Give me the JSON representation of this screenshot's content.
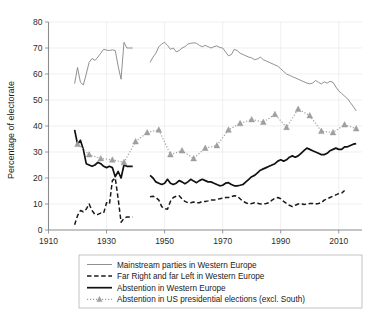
{
  "chart_data": {
    "type": "line",
    "title": "",
    "xlabel": "",
    "ylabel": "Percentage of electorate",
    "xlim": [
      1910,
      2018
    ],
    "ylim": [
      0,
      80
    ],
    "grid": true,
    "legend_position": "bottom",
    "x_ticks": [
      "1910",
      "1930",
      "1950",
      "1970",
      "1990",
      "2010"
    ],
    "x_tick_values": [
      1910,
      1930,
      1950,
      1970,
      1990,
      2010
    ],
    "y_ticks": [
      "0",
      "10",
      "20",
      "30",
      "40",
      "50",
      "60",
      "70",
      "80"
    ],
    "y_tick_values": [
      0,
      10,
      20,
      30,
      40,
      50,
      60,
      70,
      80
    ],
    "colors": {
      "mainstream": "#8a8a8a",
      "far_right_left": "#1a1a1a",
      "abstention_we": "#111111",
      "abstention_us": "#a0a0a0",
      "grid": "#e9e9e9",
      "axis": "#8c8c8c",
      "text": "#1a1a1a"
    },
    "series": [
      {
        "name": "Mainstream parties in Western Europe",
        "style": "thin-solid",
        "color": "#8a8a8a",
        "segments": [
          {
            "x": [
              1919,
              1920,
              1921,
              1922,
              1923,
              1924,
              1925,
              1926,
              1927,
              1928,
              1929,
              1930,
              1931,
              1932,
              1933,
              1934,
              1935,
              1936,
              1937,
              1938,
              1939
            ],
            "y": [
              56.3,
              62.5,
              56.8,
              55.8,
              60.0,
              64.5,
              66.0,
              65.2,
              66.5,
              68.0,
              69.5,
              69.2,
              69.0,
              69.3,
              69.0,
              63.0,
              58.0,
              72.2,
              70.0,
              70.0,
              70.0
            ]
          },
          {
            "x": [
              1945,
              1946,
              1947,
              1948,
              1949,
              1950,
              1951,
              1952,
              1953,
              1954,
              1955,
              1956,
              1957,
              1958,
              1959,
              1960,
              1961,
              1962,
              1963,
              1964,
              1965,
              1966,
              1967,
              1968,
              1969,
              1970,
              1971,
              1972,
              1973,
              1974,
              1975,
              1976,
              1977,
              1978,
              1979,
              1980,
              1981,
              1982,
              1983,
              1984,
              1985,
              1986,
              1987,
              1988,
              1989,
              1990,
              1991,
              1992,
              1993,
              1994,
              1995,
              1996,
              1997,
              1998,
              1999,
              2000,
              2001,
              2002,
              2003,
              2004,
              2005,
              2006,
              2007,
              2008,
              2009,
              2010,
              2011,
              2012,
              2013,
              2014,
              2015,
              2016
            ],
            "y": [
              64.5,
              66.5,
              68.0,
              70.5,
              71.5,
              72.2,
              71.0,
              69.5,
              70.0,
              68.5,
              69.0,
              70.0,
              70.5,
              71.5,
              71.8,
              72.0,
              71.8,
              71.0,
              70.5,
              71.0,
              70.5,
              70.0,
              70.5,
              70.8,
              70.2,
              70.0,
              68.5,
              67.0,
              67.5,
              69.5,
              69.0,
              68.0,
              67.5,
              67.0,
              66.5,
              66.2,
              65.5,
              65.8,
              66.5,
              65.5,
              65.0,
              64.5,
              64.0,
              63.5,
              63.0,
              62.0,
              61.0,
              60.0,
              59.5,
              59.0,
              58.5,
              58.0,
              57.5,
              57.0,
              56.5,
              56.2,
              56.5,
              57.5,
              56.8,
              56.2,
              57.0,
              56.5,
              57.2,
              56.8,
              55.0,
              53.5,
              52.5,
              51.5,
              50.5,
              49.0,
              47.5,
              45.8
            ]
          }
        ]
      },
      {
        "name": "Far Right and far Left in Western Europe",
        "style": "dashed",
        "color": "#1a1a1a",
        "segments": [
          {
            "x": [
              1919,
              1920,
              1921,
              1922,
              1923,
              1924,
              1925,
              1926,
              1927,
              1928,
              1929,
              1930,
              1931,
              1932,
              1933,
              1934,
              1935,
              1936,
              1937,
              1938,
              1939
            ],
            "y": [
              2.0,
              5.5,
              7.5,
              7.0,
              8.0,
              10.0,
              7.5,
              6.0,
              6.0,
              6.5,
              6.5,
              10.5,
              10.0,
              19.0,
              20.0,
              12.0,
              3.0,
              4.5,
              5.0,
              5.0,
              5.0
            ]
          },
          {
            "x": [
              1945,
              1946,
              1947,
              1948,
              1949,
              1950,
              1951,
              1952,
              1953,
              1954,
              1955,
              1956,
              1957,
              1958,
              1959,
              1960,
              1961,
              1962,
              1963,
              1964,
              1965,
              1966,
              1967,
              1968,
              1969,
              1970,
              1971,
              1972,
              1973,
              1974,
              1975,
              1976,
              1977,
              1978,
              1979,
              1980,
              1981,
              1982,
              1983,
              1984,
              1985,
              1986,
              1987,
              1988,
              1989,
              1990,
              1991,
              1992,
              1993,
              1994,
              1995,
              1996,
              1997,
              1998,
              1999,
              2000,
              2001,
              2002,
              2003,
              2004,
              2005,
              2006,
              2007,
              2008,
              2009,
              2010,
              2011,
              2012,
              2013,
              2014,
              2015,
              2016
            ],
            "y": [
              12.8,
              13.0,
              12.5,
              11.5,
              9.0,
              8.2,
              8.0,
              11.0,
              12.5,
              13.0,
              13.2,
              12.0,
              11.0,
              10.5,
              10.5,
              10.8,
              10.5,
              10.5,
              11.0,
              11.0,
              11.2,
              11.5,
              11.5,
              11.8,
              12.0,
              12.2,
              12.5,
              12.5,
              12.8,
              13.2,
              13.0,
              12.0,
              11.0,
              10.5,
              10.0,
              10.2,
              10.5,
              10.3,
              10.0,
              10.0,
              10.2,
              10.5,
              11.5,
              12.2,
              12.5,
              12.0,
              11.0,
              10.2,
              9.5,
              9.0,
              9.5,
              10.0,
              10.2,
              9.8,
              10.0,
              10.2,
              10.2,
              10.0,
              10.2,
              10.5,
              11.5,
              12.0,
              12.5,
              13.0,
              13.5,
              14.0,
              14.2,
              15.2
            ]
          }
        ]
      },
      {
        "name": "Abstention in Western Europe",
        "style": "thick-solid",
        "color": "#111111",
        "segments": [
          {
            "x": [
              1919,
              1920,
              1921,
              1922,
              1923,
              1924,
              1925,
              1926,
              1927,
              1928,
              1929,
              1930,
              1931,
              1932,
              1933,
              1934,
              1935,
              1936,
              1937,
              1938,
              1939
            ],
            "y": [
              38.5,
              33.0,
              34.5,
              31.0,
              25.5,
              25.0,
              24.5,
              25.0,
              26.0,
              25.5,
              24.5,
              24.0,
              24.5,
              24.0,
              20.5,
              22.5,
              20.0,
              25.0,
              24.5,
              24.5,
              24.5
            ]
          },
          {
            "x": [
              1945,
              1946,
              1947,
              1948,
              1949,
              1950,
              1951,
              1952,
              1953,
              1954,
              1955,
              1956,
              1957,
              1958,
              1959,
              1960,
              1961,
              1962,
              1963,
              1964,
              1965,
              1966,
              1967,
              1968,
              1969,
              1970,
              1971,
              1972,
              1973,
              1974,
              1975,
              1976,
              1977,
              1978,
              1979,
              1980,
              1981,
              1982,
              1983,
              1984,
              1985,
              1986,
              1987,
              1988,
              1989,
              1990,
              1991,
              1992,
              1993,
              1994,
              1995,
              1996,
              1997,
              1998,
              1999,
              2000,
              2001,
              2002,
              2003,
              2004,
              2005,
              2006,
              2007,
              2008,
              2009,
              2010,
              2011,
              2012,
              2013,
              2014,
              2015,
              2016
            ],
            "y": [
              21.0,
              20.0,
              18.5,
              18.0,
              17.5,
              18.0,
              19.5,
              18.0,
              17.5,
              18.0,
              19.0,
              18.5,
              17.8,
              18.5,
              19.5,
              18.8,
              18.2,
              19.0,
              19.5,
              19.0,
              18.5,
              18.5,
              18.0,
              17.5,
              17.0,
              17.2,
              18.0,
              18.2,
              17.5,
              17.0,
              17.0,
              17.2,
              17.5,
              18.5,
              19.5,
              20.5,
              21.0,
              22.0,
              23.0,
              23.5,
              24.0,
              24.5,
              25.0,
              25.5,
              26.5,
              27.0,
              26.5,
              27.0,
              28.0,
              28.5,
              28.0,
              28.5,
              29.5,
              30.5,
              31.5,
              31.0,
              30.5,
              30.0,
              29.5,
              29.0,
              29.0,
              29.5,
              30.5,
              31.0,
              31.5,
              31.0,
              31.0,
              32.0,
              32.0,
              32.5,
              33.0,
              33.2
            ]
          }
        ]
      },
      {
        "name": "Abstention in US presidential elections (excl. South)",
        "style": "dotted-markers",
        "marker": "triangle",
        "color": "#a0a0a0",
        "segments": [
          {
            "x": [
              1920,
              1924,
              1928,
              1932,
              1936,
              1940,
              1944,
              1948,
              1952,
              1956,
              1960,
              1964,
              1968,
              1972,
              1976,
              1980,
              1984,
              1988,
              1992,
              1996,
              2000,
              2004,
              2008,
              2012,
              2016
            ],
            "y": [
              33.0,
              29.0,
              27.5,
              27.0,
              26.0,
              34.0,
              37.5,
              38.5,
              29.0,
              30.5,
              27.5,
              31.5,
              32.5,
              38.5,
              41.0,
              42.5,
              41.5,
              44.5,
              39.5,
              46.5,
              44.0,
              38.0,
              37.5,
              40.5,
              39.0
            ]
          }
        ]
      }
    ]
  },
  "axis": {
    "ylabel": "Percentage of electorate"
  },
  "legend": {
    "items": [
      {
        "label": "Mainstream parties in Western Europe",
        "style": "thin-solid"
      },
      {
        "label": "Far Right and far Left in Western Europe",
        "style": "dashed"
      },
      {
        "label": "Abstention in Western Europe",
        "style": "thick-solid"
      },
      {
        "label": "Abstention in US presidential elections (excl. South)",
        "style": "dotted-markers"
      }
    ]
  }
}
